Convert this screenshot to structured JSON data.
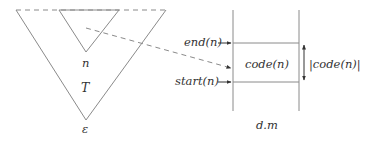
{
  "diagram": {
    "tree": {
      "outer_label": "T",
      "node_label": "n",
      "root_label": "ε"
    },
    "memory": {
      "end_label": "end(n)",
      "start_label": "start(n)",
      "code_label": "code(n)",
      "size_label": "|code(n)|",
      "region_label": "d.m"
    },
    "colors": {
      "stroke": "#8a8a8a",
      "text": "#333333",
      "background": "#ffffff"
    }
  }
}
